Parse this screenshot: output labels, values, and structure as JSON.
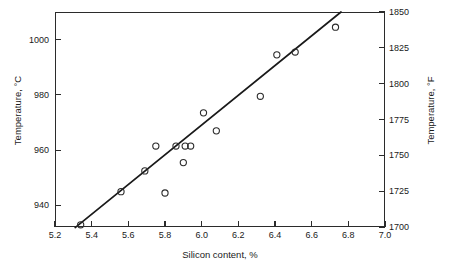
{
  "chart_data": {
    "type": "scatter",
    "title": "",
    "xlabel": "Silicon content, %",
    "ylabel": "Temperature, °C",
    "ylabel_secondary": "Temperature, °F",
    "xlim": [
      5.2,
      7.0
    ],
    "ylim": [
      932.2,
      1010.0
    ],
    "ylim_secondary": [
      1700,
      1850
    ],
    "xticks": [
      "5.2",
      "5.4",
      "5.6",
      "5.8",
      "6.0",
      "6.2",
      "6.4",
      "6.6",
      "6.8",
      "7.0"
    ],
    "xtick_values": [
      5.2,
      5.4,
      5.6,
      5.8,
      6.0,
      6.2,
      6.4,
      6.6,
      6.8,
      7.0
    ],
    "yticks": [
      "940",
      "960",
      "980",
      "1000"
    ],
    "ytick_values": [
      940,
      960,
      980,
      1000
    ],
    "yticks_secondary": [
      "1700",
      "1725",
      "1750",
      "1775",
      "1800",
      "1825",
      "1850"
    ],
    "ytick_values_secondary": [
      1700,
      1725,
      1750,
      1775,
      1800,
      1825,
      1850
    ],
    "grid": false,
    "legend": "none",
    "marker_style": "open-circle",
    "series": [
      {
        "name": "measurements",
        "points": [
          {
            "x": 5.34,
            "y": 933
          },
          {
            "x": 5.56,
            "y": 945
          },
          {
            "x": 5.69,
            "y": 952.5
          },
          {
            "x": 5.75,
            "y": 961.5
          },
          {
            "x": 5.8,
            "y": 944.5
          },
          {
            "x": 5.86,
            "y": 961.5
          },
          {
            "x": 5.9,
            "y": 955.5
          },
          {
            "x": 5.91,
            "y": 961.5
          },
          {
            "x": 5.94,
            "y": 961.5
          },
          {
            "x": 6.01,
            "y": 973.5
          },
          {
            "x": 6.08,
            "y": 967
          },
          {
            "x": 6.32,
            "y": 979.5
          },
          {
            "x": 6.41,
            "y": 994.5
          },
          {
            "x": 6.51,
            "y": 995.5
          },
          {
            "x": 6.73,
            "y": 1004.5
          }
        ]
      }
    ],
    "fit_line": {
      "name": "linear regression",
      "x_start": 5.31,
      "y_start": 932.0,
      "x_end": 6.76,
      "y_end": 1010.0
    },
    "colors": {
      "axis": "#2b2b2b",
      "marker": "#2b2b2b",
      "fit_line": "#1a1a1a",
      "background": "#ffffff"
    }
  }
}
